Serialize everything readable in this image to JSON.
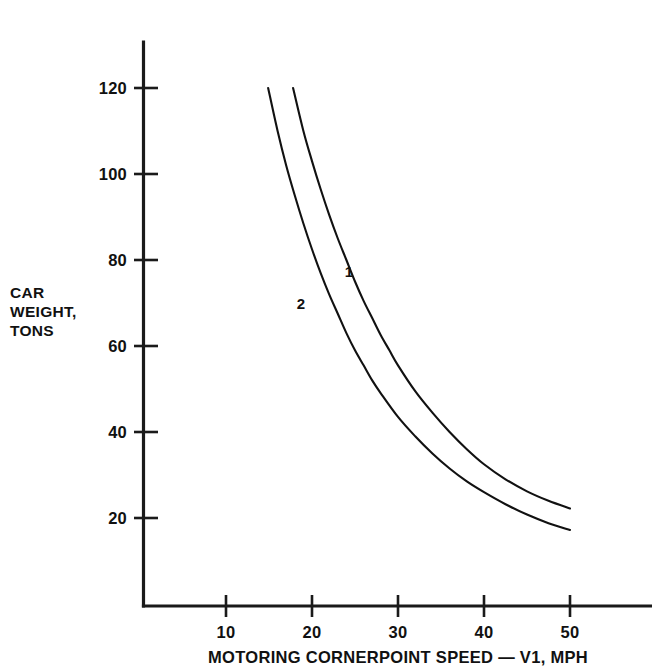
{
  "chart_data": {
    "type": "line",
    "title": "",
    "subtitle": "",
    "xlabel": "MOTORING CORNERPOINT SPEED — V1, MPH",
    "ylabel_lines": [
      "CAR",
      "WEIGHT,",
      "TONS"
    ],
    "ylabel": "CAR WEIGHT, TONS",
    "xlim": [
      0,
      56
    ],
    "ylim": [
      0,
      130
    ],
    "xticks": [
      10,
      20,
      30,
      40,
      50
    ],
    "xtick_labels": [
      "10",
      "20",
      "30",
      "40",
      "50"
    ],
    "yticks": [
      20,
      40,
      60,
      80,
      100,
      120
    ],
    "ytick_labels": [
      "20",
      "40",
      "60",
      "80",
      "100",
      "120"
    ],
    "grid": false,
    "legend": "inline-curve-labels",
    "series": [
      {
        "name": "1",
        "label": "1",
        "label_point": {
          "x": 24.3,
          "y": 76.0
        },
        "color": "#111111",
        "x": [
          17.8,
          19.0,
          20.0,
          21.0,
          22.0,
          23.0,
          24.0,
          25.0,
          26.0,
          27.0,
          28.0,
          29.0,
          30.0,
          32.0,
          34.0,
          36.0,
          38.0,
          40.0,
          42.5,
          45.0,
          47.5,
          50.0
        ],
        "y": [
          120.0,
          110.0,
          103.0,
          96.5,
          90.5,
          85.0,
          80.0,
          75.0,
          70.5,
          66.5,
          62.5,
          59.0,
          55.5,
          49.5,
          44.5,
          40.0,
          36.0,
          32.5,
          29.0,
          26.2,
          24.0,
          22.2
        ]
      },
      {
        "name": "2",
        "label": "2",
        "label_point": {
          "x": 18.7,
          "y": 68.5
        },
        "color": "#111111",
        "x": [
          14.9,
          16.0,
          17.0,
          18.0,
          19.0,
          20.0,
          21.0,
          22.0,
          23.0,
          24.0,
          25.0,
          26.0,
          27.0,
          28.0,
          30.0,
          32.0,
          34.0,
          36.0,
          38.0,
          40.0,
          42.5,
          45.0,
          47.5,
          50.0
        ],
        "y": [
          120.0,
          110.0,
          102.0,
          95.0,
          88.5,
          82.5,
          77.0,
          72.0,
          67.5,
          63.0,
          59.0,
          55.5,
          52.0,
          49.0,
          43.5,
          39.0,
          35.0,
          31.5,
          28.5,
          26.0,
          23.2,
          20.8,
          18.8,
          17.2
        ]
      }
    ]
  },
  "axis_style": {
    "line_color": "#1a1a1a",
    "curve_color": "#111111",
    "background": "#ffffff"
  }
}
